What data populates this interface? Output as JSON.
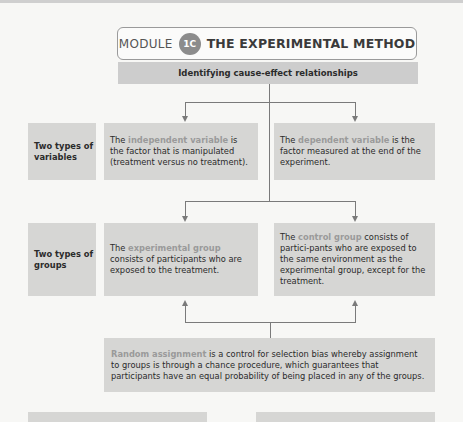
{
  "header": {
    "module_word": "MODULE",
    "module_number": "1C",
    "title": "THE EXPERIMENTAL METHOD",
    "subtitle": "Identifying cause-effect relationships"
  },
  "rows": [
    {
      "label": "Two types of variables",
      "left": {
        "prefix": "The ",
        "term": "independent variable",
        "suffix": " is the factor that is manipulated (treatment versus no treatment)."
      },
      "right": {
        "prefix": "The ",
        "term": "dependent variable",
        "suffix": " is the factor measured at the end of the experiment."
      }
    },
    {
      "label": "Two types of groups",
      "left": {
        "prefix": "The ",
        "term": "experimental group",
        "suffix": " consists of participants who are exposed to the treatment."
      },
      "right": {
        "prefix": "The ",
        "term": "control group",
        "suffix": " consists of partici-pants who are exposed to the same environment as the experimental group, except for the treatment."
      }
    }
  ],
  "random_assignment": {
    "term": "Random assignment",
    "suffix": " is a control for selection bias whereby assignment to groups is through a chance procedure, which guarantees that participants have an equal probability of being placed in any of the groups."
  },
  "colors": {
    "box_fill": "#d6d6d4",
    "subtitle_fill": "#cdcdcd",
    "badge_fill": "#8c8c8c",
    "highlight_term": "#9a9a9a",
    "connector": "#7a7a7a"
  }
}
